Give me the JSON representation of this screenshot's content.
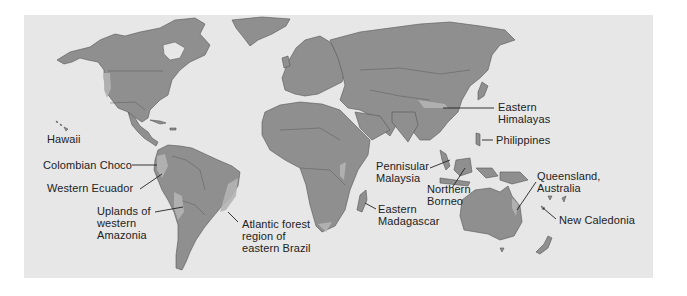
{
  "map": {
    "type": "world-biodiversity-hotspots",
    "colors": {
      "page_background": "#ffffff",
      "ocean": "#e7e7e7",
      "land": "#8f8f8f",
      "hotspot": "#b4b4b4",
      "borders": "#555555",
      "text": "#222222"
    },
    "labels": {
      "hawaii": "Hawaii",
      "colombian_choco": "Colombian Choco",
      "western_ecuador": "Western Ecuador",
      "uplands_amazonia": "Uplands of\nwestern\nAmazonia",
      "atlantic_forest": "Atlantic forest\nregion of\neastern Brazil",
      "eastern_madagascar": "Eastern\nMadagascar",
      "peninsular_malaysia": "Pennisular\nMalaysia",
      "northern_borneo": "Northern\nBorneo",
      "eastern_himalayas": "Eastern\nHimalayas",
      "philippines": "Philippines",
      "queensland": "Queensland,\nAustralia",
      "new_caledonia": "New Caledonia"
    }
  }
}
